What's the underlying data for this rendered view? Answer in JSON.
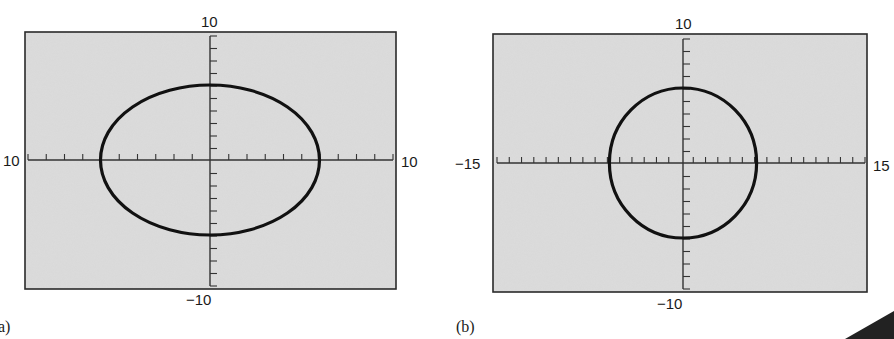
{
  "chart_data": [
    {
      "type": "line",
      "panel_label": "(a)",
      "title": "",
      "equation_depicted": "x^2 + y^2 = 36 (circle of radius 6)",
      "xlim": [
        -10,
        10
      ],
      "ylim": [
        -10,
        10
      ],
      "x_tick_step": 1,
      "y_tick_step": 1,
      "tick_labels": {
        "top": "10",
        "bottom": "−10",
        "left": "10",
        "right": "10"
      },
      "grid": false,
      "shape": {
        "kind": "ellipse-on-screen",
        "center": [
          0,
          0
        ],
        "rx": 6,
        "ry": 6
      },
      "note": "Same circle appears as an ellipse because the viewing window is not square"
    },
    {
      "type": "line",
      "panel_label": "(b)",
      "title": "",
      "equation_depicted": "x^2 + y^2 = 36 (circle of radius 6)",
      "xlim": [
        -15,
        15
      ],
      "ylim": [
        -10,
        10
      ],
      "x_tick_step": 1,
      "y_tick_step": 1,
      "tick_labels": {
        "top": "10",
        "bottom": "−10",
        "left": "−15",
        "right": "15"
      },
      "grid": false,
      "shape": {
        "kind": "circle",
        "center": [
          0,
          0
        ],
        "rx": 6,
        "ry": 6
      },
      "note": "Squared viewing window shows the circle as round"
    }
  ],
  "captions": {
    "a": "a)",
    "b": "(b)"
  },
  "colors": {
    "screen_bg": "#dcdcdc",
    "frame": "#2a2a2a",
    "curve": "#111111",
    "axis": "#333333"
  },
  "layout": {
    "a": {
      "x0": 25,
      "y0": 32,
      "x1": 396,
      "y1": 289,
      "ax_x": 210,
      "ax_y": 160,
      "tick_top": 36,
      "tick_bottom": 286,
      "tick_left": 28,
      "tick_right": 393
    },
    "b": {
      "x0": 493,
      "y0": 34,
      "x1": 867,
      "y1": 292,
      "ax_x": 683,
      "ax_y": 163,
      "tick_top": 39,
      "tick_bottom": 289,
      "tick_left": 497,
      "tick_right": 865
    }
  }
}
